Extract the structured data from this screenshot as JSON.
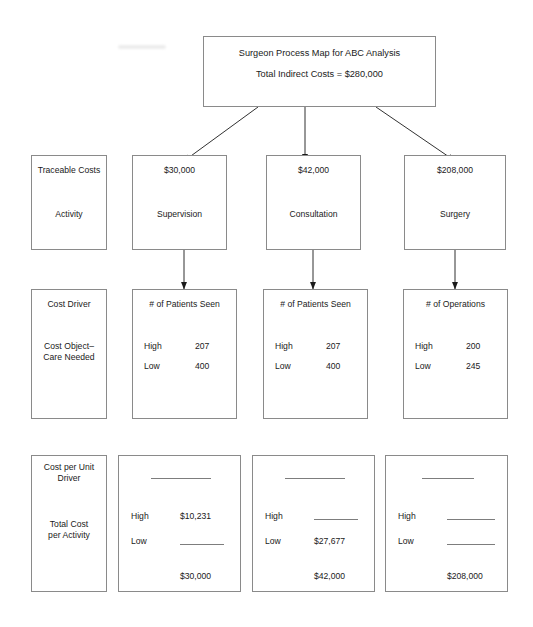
{
  "diagram": {
    "title_box": {
      "line1": "Surgeon Process Map for ABC Analysis",
      "line2": "Total Indirect Costs  =  $280,000"
    },
    "row_labels": {
      "activity_header": "Traceable Costs",
      "activity_body": "Activity",
      "driver_header": "Cost Driver",
      "driver_body_line1": "Cost Object–",
      "driver_body_line2": "Care Needed",
      "cost_header_line1": "Cost per Unit",
      "cost_header_line2": "Driver",
      "cost_body_line1": "Total Cost",
      "cost_body_line2": "per Activity"
    },
    "high_label": "High",
    "low_label": "Low",
    "blank_value": "",
    "columns": [
      {
        "amount": "$30,000",
        "activity": "Supervision",
        "driver_name": "# of Patients Seen",
        "driver_high": "207",
        "driver_low": "400",
        "unit_rate": "",
        "cost_high": "$10,231",
        "cost_low": "",
        "total": "$30,000"
      },
      {
        "amount": "$42,000",
        "activity": "Consultation",
        "driver_name": "# of Patients Seen",
        "driver_high": "207",
        "driver_low": "400",
        "unit_rate": "",
        "cost_high": "",
        "cost_low": "$27,677",
        "total": "$42,000"
      },
      {
        "amount": "$208,000",
        "activity": "Surgery",
        "driver_name": "# of Operations",
        "driver_high": "200",
        "driver_low": "245",
        "unit_rate": "",
        "cost_high": "",
        "cost_low": "",
        "total": "$208,000"
      }
    ],
    "colors": {
      "border": "#8a8a8a",
      "text": "#1a1a1a",
      "rule": "#7d7d7d",
      "background": "#ffffff"
    }
  }
}
